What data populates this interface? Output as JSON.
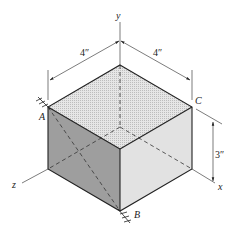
{
  "figure": {
    "axes": {
      "y": "y",
      "x": "x",
      "z": "z"
    },
    "points": {
      "A": "A",
      "B": "B",
      "C": "C"
    },
    "dimensions": {
      "width_left": "4″",
      "width_right": "4″",
      "height": "3″"
    },
    "colors": {
      "top_face": "#dcdcdc",
      "left_face": "#9a9a9a",
      "right_face": "#e4e4e4",
      "edge": "#222222"
    }
  }
}
